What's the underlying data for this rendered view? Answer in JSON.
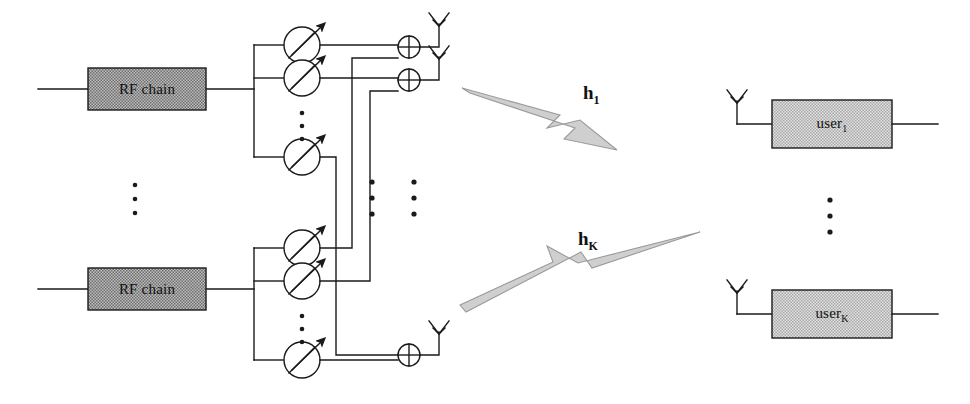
{
  "diagram": {
    "type": "block-diagram",
    "background_color": "#ffffff",
    "line_color": "#1a1a1a",
    "rf_block_fill": "#9a9a9a",
    "user_block_fill": "#c9c9c9",
    "bolt_fill": "#cfcfcf",
    "bolt_stroke": "#8a8a8a"
  },
  "transmitter": {
    "rf_chains": [
      {
        "id": "rf-chain-1",
        "label": "RF chain",
        "x": 88,
        "y": 68,
        "w": 118,
        "h": 42
      },
      {
        "id": "rf-chain-2",
        "label": "RF chain",
        "x": 88,
        "y": 268,
        "w": 118,
        "h": 42
      }
    ],
    "rf_chain_vertical_ellipsis": {
      "label": "⋮",
      "x": 135,
      "y": 185,
      "dots": 3
    },
    "phase_shifters": [
      {
        "id": "ps-1-1",
        "cx": 302,
        "cy": 45
      },
      {
        "id": "ps-1-2",
        "cx": 302,
        "cy": 78
      },
      {
        "id": "ps-1-3",
        "cx": 302,
        "cy": 157
      },
      {
        "id": "ps-2-1",
        "cx": 302,
        "cy": 248
      },
      {
        "id": "ps-2-2",
        "cx": 302,
        "cy": 281
      },
      {
        "id": "ps-2-3",
        "cx": 302,
        "cy": 360
      }
    ],
    "phase_shifter_ellipses": [
      {
        "x": 302,
        "y": 113,
        "dots": 3
      },
      {
        "x": 302,
        "y": 316,
        "dots": 3
      }
    ],
    "summers": [
      {
        "id": "summer-1",
        "cx": 409,
        "cy": 47
      },
      {
        "id": "summer-2",
        "cx": 409,
        "cy": 80
      },
      {
        "id": "summer-3",
        "cx": 409,
        "cy": 355
      }
    ],
    "tx_antennas": [
      {
        "id": "tx-antenna-1",
        "x": 439,
        "y": 47
      },
      {
        "id": "tx-antenna-2",
        "x": 439,
        "y": 80
      },
      {
        "id": "tx-antenna-3",
        "x": 439,
        "y": 355
      }
    ],
    "antenna_array_ellipses": [
      {
        "x": 372,
        "y": 182,
        "dots": 3
      },
      {
        "x": 412,
        "y": 182,
        "dots": 3
      }
    ]
  },
  "channels": [
    {
      "id": "channel-1",
      "label": "h",
      "subscript": "1",
      "label_x": 583,
      "label_y": 82,
      "direction": "down"
    },
    {
      "id": "channel-k",
      "label": "h",
      "subscript": "K",
      "label_x": 578,
      "label_y": 228,
      "direction": "up"
    }
  ],
  "receivers": {
    "users": [
      {
        "id": "user-1",
        "label": "user",
        "subscript": "1",
        "x": 772,
        "y": 100,
        "w": 120,
        "h": 48,
        "antenna_x": 737,
        "antenna_y": 124
      },
      {
        "id": "user-k",
        "label": "user",
        "subscript": "K",
        "x": 772,
        "y": 290,
        "w": 120,
        "h": 48,
        "antenna_x": 737,
        "antenna_y": 314
      }
    ],
    "user_vertical_ellipsis": {
      "label": "⋮",
      "x": 830,
      "y": 200,
      "dots": 3
    }
  }
}
